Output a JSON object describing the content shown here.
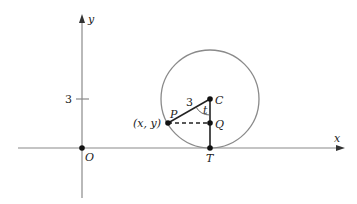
{
  "diagram": {
    "axes": {
      "x_label": "x",
      "y_label": "y",
      "origin_label": "O",
      "y_tick_label": "3"
    },
    "points": {
      "P_label": "P",
      "P_coords_label": "(x, y)",
      "C_label": "C",
      "Q_label": "Q",
      "T_label": "T"
    },
    "segment_labels": {
      "radius_label": "3",
      "angle_label": "t"
    },
    "colors": {
      "axis": "#8a8a8a",
      "circle": "#8a8a8a",
      "segment": "#222222",
      "point": "#111111"
    }
  }
}
